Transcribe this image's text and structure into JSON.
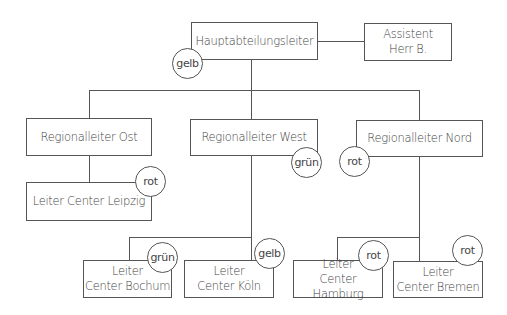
{
  "diagram": {
    "type": "org-chart",
    "top": {
      "title": "Hauptabteilungsleiter",
      "status": "gelb"
    },
    "assistant": {
      "line1": "Assistent",
      "line2": "Herr B."
    },
    "regions": [
      {
        "title": "Regionalleiter Ost",
        "status": null,
        "centers": [
          {
            "line1": "Leiter Center Leipzig",
            "status": "rot"
          }
        ]
      },
      {
        "title": "Regionalleiter West",
        "status": "grün",
        "centers": [
          {
            "line1": "Leiter",
            "line2": "Center Bochum",
            "status": "grün"
          },
          {
            "line1": "Leiter",
            "line2": "Center Köln",
            "status": "gelb"
          }
        ]
      },
      {
        "title": "Regionalleiter Nord",
        "status": "rot",
        "centers": [
          {
            "line1": "Leiter",
            "line2": "Center Hamburg",
            "status": "rot"
          },
          {
            "line1": "Leiter",
            "line2": "Center Bremen",
            "status": "rot"
          }
        ]
      }
    ]
  }
}
